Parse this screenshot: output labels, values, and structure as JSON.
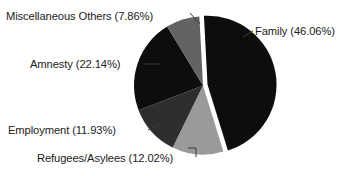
{
  "chart_data": {
    "type": "pie",
    "title": "",
    "subtitle": "",
    "xlabel": "",
    "ylabel": "",
    "legend_position": "none",
    "grid": false,
    "labels_with_leader_lines": true,
    "categories": [
      "Family",
      "Refugees/Asylees",
      "Employment",
      "Amnesty",
      "Miscellaneous Others"
    ],
    "values": [
      46.06,
      12.02,
      11.93,
      22.14,
      7.86
    ],
    "value_unit": "%",
    "slices": [
      {
        "name": "Family",
        "value": 46.06,
        "label": "Family (46.06%)",
        "color": "#0d0d0d",
        "exploded": true
      },
      {
        "name": "Refugees/Asylees",
        "value": 12.02,
        "label": "Refugees/Asylees (12.02%)",
        "color": "#9a9a9a",
        "exploded": false
      },
      {
        "name": "Employment",
        "value": 11.93,
        "label": "Employment (11.93%)",
        "color": "#2e2e2e",
        "exploded": false
      },
      {
        "name": "Amnesty",
        "value": 22.14,
        "label": "Amnesty (22.14%)",
        "color": "#0d0d0d",
        "exploded": false
      },
      {
        "name": "Miscellaneous Others",
        "value": 7.86,
        "label": "Miscellaneous Others (7.86%)",
        "color": "#636363",
        "exploded": false
      }
    ]
  },
  "labels": {
    "misc": "Miscellaneous Others (7.86%)",
    "family": "Family (46.06%)",
    "amnesty": "Amnesty (22.14%)",
    "employment": "Employment (11.93%)",
    "refugees": "Refugees/Asylees (12.02%)"
  },
  "colors": {
    "background": "#ffffff",
    "text": "#1b1b1b",
    "leader_line": "#3a3a3a",
    "slice_family": "#0d0d0d",
    "slice_refugees": "#9a9a9a",
    "slice_employment": "#2e2e2e",
    "slice_amnesty": "#0d0d0d",
    "slice_misc": "#636363"
  }
}
